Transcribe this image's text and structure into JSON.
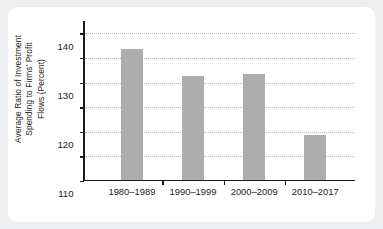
{
  "chart_data": {
    "type": "bar",
    "title": "",
    "xlabel": "",
    "ylabel": "Average Ratio of Investment\nSpending to Firms' Profit\nFlows (Percent)",
    "categories": [
      "1980–1989",
      "1990–1999",
      "2000–2009",
      "2010–2017"
    ],
    "values": [
      133,
      122,
      123,
      98
    ],
    "ylim": [
      80,
      145
    ],
    "yticks": [
      80,
      90,
      100,
      110,
      120,
      130,
      140
    ],
    "ytick_labels": [
      "80",
      "90",
      "100",
      "110",
      "120",
      "130",
      "140"
    ],
    "grid": "horizontal-dotted",
    "legend": "none",
    "bar_color": "#adadad",
    "axis_color": "#1a1a1a",
    "gridline_color": "#b9b9b9",
    "background_color": "#ffffff",
    "page_background_color": "#eceef0"
  }
}
